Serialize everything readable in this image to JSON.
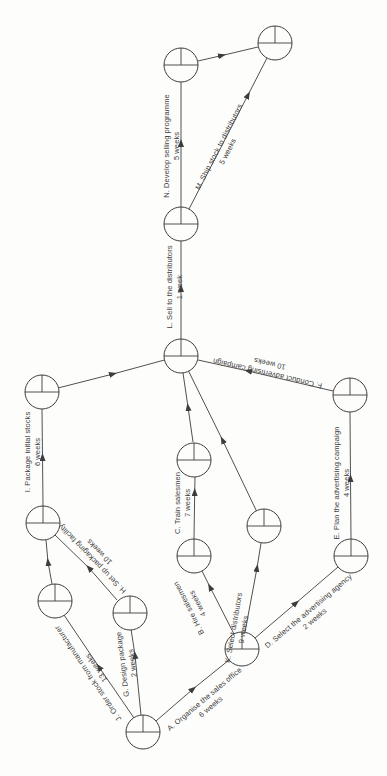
{
  "diagram": {
    "kind_label": "",
    "activities": [
      {
        "code": "A",
        "label": "A. Organise the sales office",
        "duration": "6 weeks"
      },
      {
        "code": "B",
        "label": "B. Hire salesmen",
        "duration": "4 weeks"
      },
      {
        "code": "C",
        "label": "C. Train salesmen",
        "duration": "7 weeks"
      },
      {
        "code": "D",
        "label": "D. Select the advertising agency",
        "duration": "2 weeks"
      },
      {
        "code": "E",
        "label": "E. Plan the advertising campaign",
        "duration": "4 weeks"
      },
      {
        "code": "F",
        "label": "F. Conduct advertising campaign",
        "duration": "10 weeks"
      },
      {
        "code": "G",
        "label": "G. Design package",
        "duration": "2 weeks"
      },
      {
        "code": "H",
        "label": "H. Set up packaging facility",
        "duration": "10 weeks"
      },
      {
        "code": "I",
        "label": "I. Package initial stocks",
        "duration": "6 weeks"
      },
      {
        "code": "J",
        "label": "J. Order stock from manufacturer",
        "duration": "13 weeks"
      },
      {
        "code": "K",
        "label": "K. Select distributors",
        "duration": "9 weeks"
      },
      {
        "code": "L",
        "label": "L. Sell to the distributors",
        "duration": "1 week"
      },
      {
        "code": "M",
        "label": "M. Ship stock to distributors",
        "duration": "5 weeks"
      },
      {
        "code": "N",
        "label": "N. Develop selling programme",
        "duration": "5 weeks"
      }
    ],
    "style": {
      "ink_color": "#3d3d3d",
      "paper_color": "#fdfdfc"
    }
  }
}
